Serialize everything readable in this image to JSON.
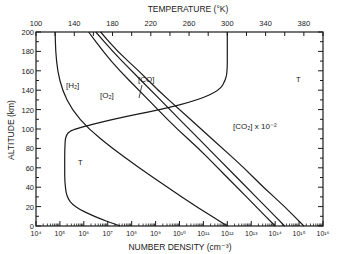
{
  "chart_data": {
    "type": "line",
    "title": "",
    "xlabel": "NUMBER DENSITY (cm⁻³)",
    "x2label": "TEMPERATURE (°K)",
    "ylabel": "ALTITUDE (km)",
    "xscale": "log",
    "xlim": [
      10000.0,
      1e+16
    ],
    "x2lim": [
      100,
      400
    ],
    "ylim": [
      0,
      200
    ],
    "x_tick_labels": [
      "10⁴",
      "10⁵",
      "10⁶",
      "10⁷",
      "10⁸",
      "10⁹",
      "10¹⁰",
      "10¹¹",
      "10¹²",
      "10¹³",
      "10¹⁴",
      "10¹⁵",
      "10¹⁶"
    ],
    "x2_tick_labels": [
      "100",
      "140",
      "180",
      "220",
      "260",
      "300",
      "340",
      "380"
    ],
    "y_tick_labels": [
      "0",
      "20",
      "40",
      "60",
      "80",
      "100",
      "120",
      "140",
      "160",
      "180",
      "200"
    ],
    "grid": false,
    "series": [
      {
        "name": "[H₂]",
        "axis": "log10 density",
        "points": [
          [
            4.8,
            200
          ],
          [
            4.82,
            180
          ],
          [
            4.9,
            160
          ],
          [
            5.1,
            140
          ],
          [
            5.5,
            120
          ],
          [
            6.2,
            100
          ],
          [
            7.2,
            80
          ],
          [
            8.3,
            60
          ],
          [
            9.5,
            40
          ],
          [
            10.7,
            20
          ],
          [
            12.0,
            0
          ]
        ]
      },
      {
        "name": "[O₂]",
        "axis": "log10 density",
        "points": [
          [
            6.2,
            200
          ],
          [
            6.8,
            180
          ],
          [
            7.5,
            160
          ],
          [
            8.3,
            140
          ],
          [
            9.1,
            120
          ],
          [
            9.9,
            100
          ],
          [
            10.8,
            80
          ],
          [
            11.6,
            60
          ],
          [
            12.4,
            40
          ],
          [
            13.2,
            20
          ],
          [
            14.0,
            0
          ]
        ]
      },
      {
        "name": "[CO]",
        "axis": "log10 density",
        "points": [
          [
            6.5,
            200
          ],
          [
            7.2,
            180
          ],
          [
            8.0,
            160
          ],
          [
            8.8,
            140
          ],
          [
            9.6,
            120
          ],
          [
            10.4,
            100
          ],
          [
            11.2,
            80
          ],
          [
            12.0,
            60
          ],
          [
            12.8,
            40
          ],
          [
            13.6,
            20
          ],
          [
            14.4,
            0
          ]
        ]
      },
      {
        "name": "[CO₂] x 10⁻²",
        "axis": "log10 density",
        "points": [
          [
            6.7,
            200
          ],
          [
            7.4,
            180
          ],
          [
            8.3,
            160
          ],
          [
            9.1,
            140
          ],
          [
            10.0,
            120
          ],
          [
            10.9,
            100
          ],
          [
            11.8,
            80
          ],
          [
            12.7,
            60
          ],
          [
            13.5,
            40
          ],
          [
            14.4,
            20
          ],
          [
            15.2,
            0
          ]
        ]
      },
      {
        "name": "T",
        "axis": "temperature K",
        "points": [
          [
            188,
            0
          ],
          [
            160,
            10
          ],
          [
            140,
            20
          ],
          [
            132,
            30
          ],
          [
            130,
            45
          ],
          [
            130,
            60
          ],
          [
            130,
            80
          ],
          [
            131,
            95
          ],
          [
            140,
            100
          ],
          [
            180,
            110
          ],
          [
            230,
            120
          ],
          [
            270,
            130
          ],
          [
            292,
            140
          ],
          [
            298,
            150
          ],
          [
            300,
            160
          ],
          [
            300,
            180
          ],
          [
            300,
            200
          ]
        ]
      }
    ],
    "annotations": [
      "[H₂]",
      "[O₂]",
      "[CO]",
      "[CO₂] x 10⁻²",
      "T",
      "T"
    ]
  }
}
